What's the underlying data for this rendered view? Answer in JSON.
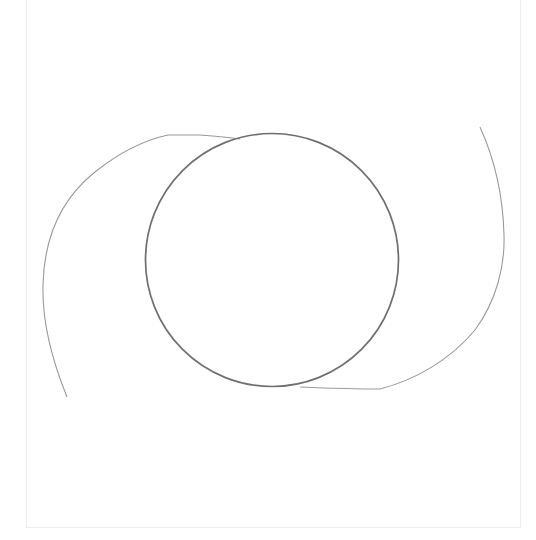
{
  "drawing": {
    "title": "",
    "elements": [
      {
        "kind": "circle",
        "name": "center-circle",
        "color": "#6f6f6f"
      },
      {
        "kind": "arc",
        "name": "left-swirl-arc",
        "color": "#9a9a9a"
      },
      {
        "kind": "arc",
        "name": "right-swirl-arc",
        "color": "#9a9a9a"
      }
    ],
    "frame_color": "#ececec",
    "background": "#ffffff"
  }
}
